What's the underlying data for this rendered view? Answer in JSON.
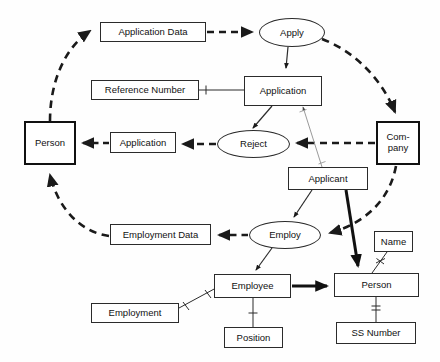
{
  "diagram": {
    "colors": {
      "line": "#2b2b2b",
      "thick_line": "#111111",
      "thin_line": "#8a8a8a",
      "background": "#ffffff",
      "text": "#111111"
    },
    "nodes": [
      {
        "id": "application_data",
        "label": "Application Data",
        "shape": "box",
        "x": 100,
        "y": 22,
        "w": 106,
        "h": 20
      },
      {
        "id": "apply",
        "label": "Apply",
        "shape": "ellipse",
        "x": 259,
        "y": 18,
        "w": 66,
        "h": 29
      },
      {
        "id": "reference_number",
        "label": "Reference Number",
        "shape": "box",
        "x": 91,
        "y": 80,
        "w": 108,
        "h": 20
      },
      {
        "id": "application_entity",
        "label": "Application",
        "shape": "box",
        "x": 244,
        "y": 76,
        "w": 78,
        "h": 30
      },
      {
        "id": "person_left",
        "label": "Person",
        "shape": "box-thick",
        "x": 24,
        "y": 121,
        "w": 52,
        "h": 44
      },
      {
        "id": "application_msg",
        "label": "Application",
        "shape": "box",
        "x": 110,
        "y": 132,
        "w": 66,
        "h": 21
      },
      {
        "id": "reject",
        "label": "Reject",
        "shape": "ellipse",
        "x": 217,
        "y": 130,
        "w": 73,
        "h": 28
      },
      {
        "id": "company",
        "label": "Com-\npany",
        "label_line1": "Com-",
        "label_line2": "pany",
        "shape": "box-thick",
        "x": 376,
        "y": 121,
        "w": 44,
        "h": 44
      },
      {
        "id": "applicant",
        "label": "Applicant",
        "shape": "box",
        "x": 288,
        "y": 167,
        "w": 80,
        "h": 23
      },
      {
        "id": "employment_data",
        "label": "Employment Data",
        "shape": "box",
        "x": 110,
        "y": 224,
        "w": 101,
        "h": 21
      },
      {
        "id": "employ",
        "label": "Employ",
        "shape": "ellipse",
        "x": 249,
        "y": 221,
        "w": 72,
        "h": 28
      },
      {
        "id": "name",
        "label": "Name",
        "shape": "box",
        "x": 374,
        "y": 231,
        "w": 39,
        "h": 21
      },
      {
        "id": "employee",
        "label": "Employee",
        "shape": "box",
        "x": 214,
        "y": 274,
        "w": 77,
        "h": 24
      },
      {
        "id": "person_bottom",
        "label": "Person",
        "shape": "box",
        "x": 334,
        "y": 273,
        "w": 85,
        "h": 24
      },
      {
        "id": "employment",
        "label": "Employment",
        "shape": "box",
        "x": 91,
        "y": 303,
        "w": 88,
        "h": 20
      },
      {
        "id": "position",
        "label": "Position",
        "shape": "box",
        "x": 224,
        "y": 327,
        "w": 59,
        "h": 21
      },
      {
        "id": "ss_number",
        "label": "SS Number",
        "shape": "box",
        "x": 336,
        "y": 322,
        "w": 80,
        "h": 22
      }
    ],
    "edges": [
      {
        "id": "person-to-application-data",
        "from": "person_left",
        "to": "application_data",
        "style": "dashed-thick-curve",
        "arrow": "filled"
      },
      {
        "id": "application-data-to-apply",
        "from": "application_data",
        "to": "apply",
        "style": "dashed-thick-straight",
        "arrow": "filled"
      },
      {
        "id": "apply-to-company",
        "from": "apply",
        "to": "company",
        "style": "dashed-thick-curve",
        "arrow": "filled"
      },
      {
        "id": "apply-to-application",
        "from": "apply",
        "to": "application_entity",
        "style": "solid-thin",
        "arrow": "filled"
      },
      {
        "id": "reference-number-to-application",
        "from": "reference_number",
        "to": "application_entity",
        "style": "solid-thin-tick",
        "arrow": "none"
      },
      {
        "id": "application-to-reject",
        "from": "application_entity",
        "to": "reject",
        "style": "solid-thin",
        "arrow": "filled"
      },
      {
        "id": "applicant-to-application",
        "from": "applicant",
        "to": "application_entity",
        "style": "solid-hairline-diagonal",
        "arrow": "none"
      },
      {
        "id": "company-to-reject",
        "from": "company",
        "to": "reject",
        "style": "dashed-thick-straight",
        "arrow": "filled"
      },
      {
        "id": "reject-to-application-msg",
        "from": "reject",
        "to": "application_msg",
        "style": "dashed-thick-straight",
        "arrow": "filled"
      },
      {
        "id": "application-msg-to-person",
        "from": "application_msg",
        "to": "person_left",
        "style": "dashed-thick-straight",
        "arrow": "filled"
      },
      {
        "id": "company-to-employ",
        "from": "company",
        "to": "employ",
        "style": "dashed-thick-curve",
        "arrow": "filled"
      },
      {
        "id": "applicant-to-employ",
        "from": "applicant",
        "to": "employ",
        "style": "solid-thin",
        "arrow": "filled"
      },
      {
        "id": "applicant-to-person-bottom",
        "from": "applicant",
        "to": "person_bottom",
        "style": "solid-thick",
        "arrow": "filled"
      },
      {
        "id": "employ-to-employment-data",
        "from": "employ",
        "to": "employment_data",
        "style": "dashed-thick-straight",
        "arrow": "filled"
      },
      {
        "id": "employment-data-to-person",
        "from": "employment_data",
        "to": "person_left",
        "style": "dashed-thick-curve",
        "arrow": "filled"
      },
      {
        "id": "employ-to-employee",
        "from": "employ",
        "to": "employee",
        "style": "solid-thin",
        "arrow": "filled"
      },
      {
        "id": "employment-to-employee",
        "from": "employment",
        "to": "employee",
        "style": "solid-thin-crowfoot",
        "arrow": "none"
      },
      {
        "id": "employee-to-position",
        "from": "employee",
        "to": "position",
        "style": "solid-thin-tick",
        "arrow": "none"
      },
      {
        "id": "employee-to-person-bottom",
        "from": "employee",
        "to": "person_bottom",
        "style": "solid-thick",
        "arrow": "filled"
      },
      {
        "id": "name-to-person-bottom",
        "from": "name",
        "to": "person_bottom",
        "style": "solid-thin-crowfoot",
        "arrow": "none"
      },
      {
        "id": "person-bottom-to-ss-number",
        "from": "person_bottom",
        "to": "ss_number",
        "style": "solid-thin-tick",
        "arrow": "none"
      }
    ]
  }
}
